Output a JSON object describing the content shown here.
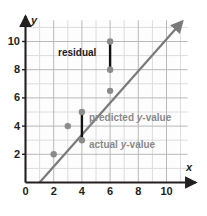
{
  "chart_data": {
    "type": "scatter",
    "title": "",
    "xlabel": "x",
    "ylabel": "y",
    "xlim": [
      0,
      11.5
    ],
    "ylim": [
      0,
      11.5
    ],
    "grid": true,
    "grid_minor_step": 1,
    "grid_major_step": 2,
    "legend_position": "none",
    "xticks": [
      "0",
      "2",
      "4",
      "6",
      "8",
      "10"
    ],
    "xtick_values": [
      0,
      2,
      4,
      6,
      8,
      10
    ],
    "yticks": [
      "0",
      "2",
      "4",
      "6",
      "8",
      "10"
    ],
    "ytick_values": [
      0,
      2,
      4,
      6,
      8,
      10
    ],
    "series": [
      {
        "name": "data points",
        "type": "scatter",
        "color": "#8c8c8c",
        "points": [
          {
            "x": 2,
            "y": 2
          },
          {
            "x": 3,
            "y": 4
          },
          {
            "x": 4,
            "y": 3
          },
          {
            "x": 4,
            "y": 5
          },
          {
            "x": 6,
            "y": 6.5
          },
          {
            "x": 6,
            "y": 8
          },
          {
            "x": 6,
            "y": 10
          }
        ]
      },
      {
        "name": "regression line",
        "type": "line",
        "color": "#7a7a7a",
        "equation": "y = 2x - 2",
        "slope": 2,
        "intercept": -2,
        "x_start": 1,
        "y_start": 0,
        "x_end": 11.1,
        "y_end": 11.4,
        "arrow_end": true
      },
      {
        "name": "residual segments",
        "type": "segments",
        "color": "#111111",
        "segments": [
          {
            "x": 4,
            "y_actual": 3,
            "y_predicted": 5,
            "residual": -2
          },
          {
            "x": 6,
            "y_actual": 10,
            "y_predicted": 8,
            "residual": 2
          }
        ]
      }
    ],
    "annotations": [
      {
        "id": "residual",
        "text": "residual",
        "color": "#1a1a1a",
        "x": 3.0,
        "y": 8.7
      },
      {
        "id": "predicted",
        "text": "predicted y-value",
        "color": "#8a8a8a",
        "x": 5.0,
        "y": 4.4
      },
      {
        "id": "actual",
        "text": "actual y-value",
        "color": "#8a8a8a",
        "x": 5.0,
        "y": 2.6
      }
    ]
  },
  "annotations": {
    "residual": "residual",
    "predicted_prefix": "predicted ",
    "predicted_var": "y",
    "predicted_suffix": "-value",
    "actual_prefix": "actual ",
    "actual_var": "y",
    "actual_suffix": "-value"
  },
  "axes": {
    "x_name": "x",
    "y_name": "y",
    "x_ticks": [
      "0",
      "2",
      "4",
      "6",
      "8",
      "10"
    ],
    "y_ticks": [
      "0",
      "2",
      "4",
      "6",
      "8",
      "10"
    ],
    "origin_label": "0"
  },
  "colors": {
    "background": "#ffffff",
    "plot_background": "#fdfdfd",
    "grid_minor": "#dcdcdc",
    "grid_major": "#b8b8b8",
    "axis": "#231f20",
    "point": "#8c8c8c",
    "line": "#7a7a7a",
    "residual": "#111111",
    "text_dark": "#1a1a1a",
    "text_gray": "#8a8a8a"
  }
}
